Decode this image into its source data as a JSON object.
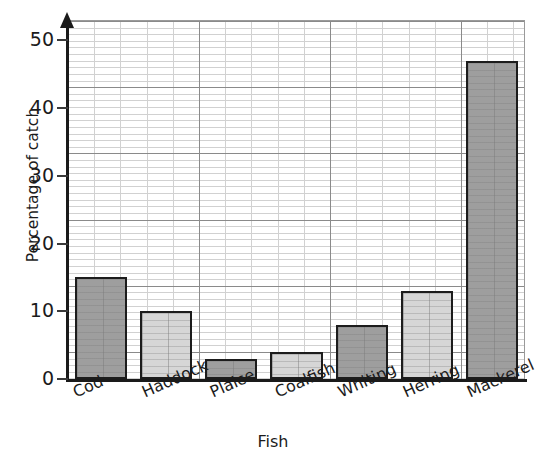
{
  "chart_data": {
    "type": "bar",
    "title": "",
    "xlabel": "Fish",
    "ylabel": "Percentage of catch",
    "categories": [
      "Cod",
      "Haddock",
      "Plaice",
      "Coalfish",
      "Whiting",
      "Herring",
      "Mackerel"
    ],
    "values": [
      15,
      10,
      3,
      4,
      8,
      13,
      47
    ],
    "bar_shades": [
      "dark",
      "light",
      "dark",
      "light",
      "dark",
      "light",
      "dark"
    ],
    "ylim": [
      0,
      53
    ],
    "yticks": [
      0,
      10,
      20,
      30,
      40,
      50
    ],
    "ytick_labels": [
      "0",
      "10",
      "20",
      "30",
      "40",
      "50"
    ],
    "grid": "graph-paper minor gridlines every 1 unit, major every 10 units",
    "legend": "none",
    "colors": {
      "bar_dark": "#9e9e9e",
      "bar_light": "#d6d6d6",
      "bar_outline": "#1c1c1c",
      "grid_minor": "#c9c9c9",
      "grid_major": "#8a8a8a",
      "axis": "#1a1a1a",
      "text": "#1b1b1b",
      "background": "#ffffff"
    }
  },
  "axes": {
    "y_title": "Percentage of catch",
    "x_title": "Fish",
    "y_arrow": "up-arrow-icon"
  }
}
